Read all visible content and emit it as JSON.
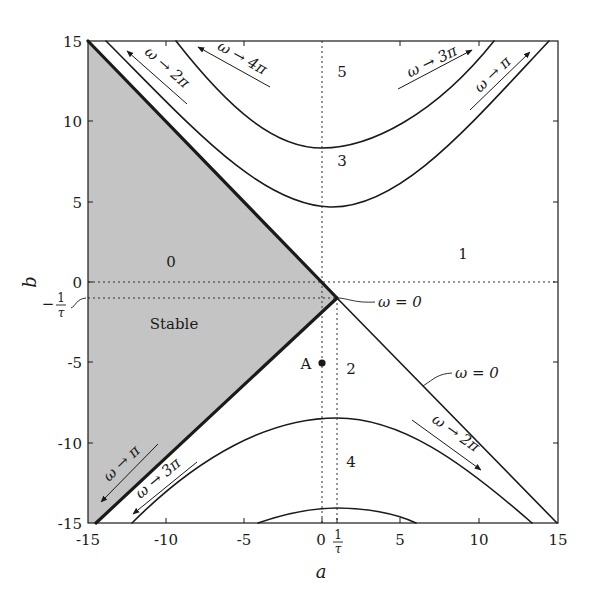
{
  "figure": {
    "x_axis": {
      "label": "a",
      "range": [
        -15,
        15
      ],
      "ticks": [
        "-15",
        "-10",
        "-5",
        "0",
        "5",
        "10",
        "15"
      ],
      "extra_tick": {
        "num": "1",
        "den": "τ"
      }
    },
    "y_axis": {
      "label": "b",
      "range": [
        -15,
        15
      ],
      "ticks": [
        "15",
        "10",
        "5",
        "0",
        "-5",
        "-10",
        "-15"
      ],
      "extra_tick": {
        "sign": "−",
        "num": "1",
        "den": "τ"
      }
    },
    "regions": {
      "r0": "0",
      "r1": "1",
      "r2": "2",
      "r3": "3",
      "r4": "4",
      "r5": "5",
      "stable": "Stable"
    },
    "point": {
      "label": "A",
      "a": 0,
      "b": -5
    },
    "annotations": {
      "omega_to_2pi_top": "ω → 2π",
      "omega_to_4pi": "ω → 4π",
      "omega_to_3pi_top": "ω → 3π",
      "omega_to_pi_top": "ω → π",
      "omega_zero_vertex": "ω = 0",
      "omega_zero_line": "ω = 0",
      "omega_to_2pi_bottom": "ω → 2π",
      "omega_to_pi_bottom": "ω → π",
      "omega_to_3pi_bottom": "ω → 3π"
    },
    "colors": {
      "stable_fill": "#c4c4c4",
      "line": "#1a1a1a",
      "background": "#ffffff"
    }
  }
}
